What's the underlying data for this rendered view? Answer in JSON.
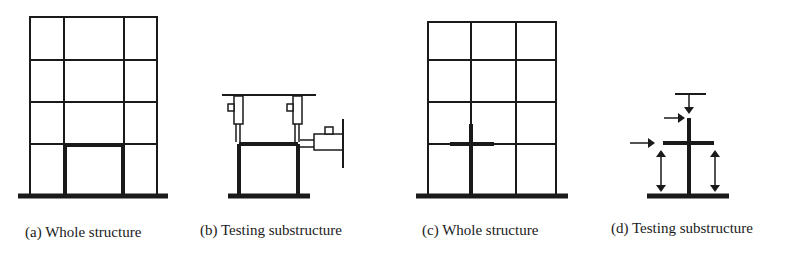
{
  "figure": {
    "panels": [
      {
        "id": "a",
        "caption": "(a) Whole structure"
      },
      {
        "id": "b",
        "caption": "(b) Testing substructure"
      },
      {
        "id": "c",
        "caption": "(c) Whole structure"
      },
      {
        "id": "d",
        "caption": "(d) Testing substructure"
      }
    ],
    "colors": {
      "line": "#1a1a1a",
      "background": "#ffffff"
    }
  }
}
